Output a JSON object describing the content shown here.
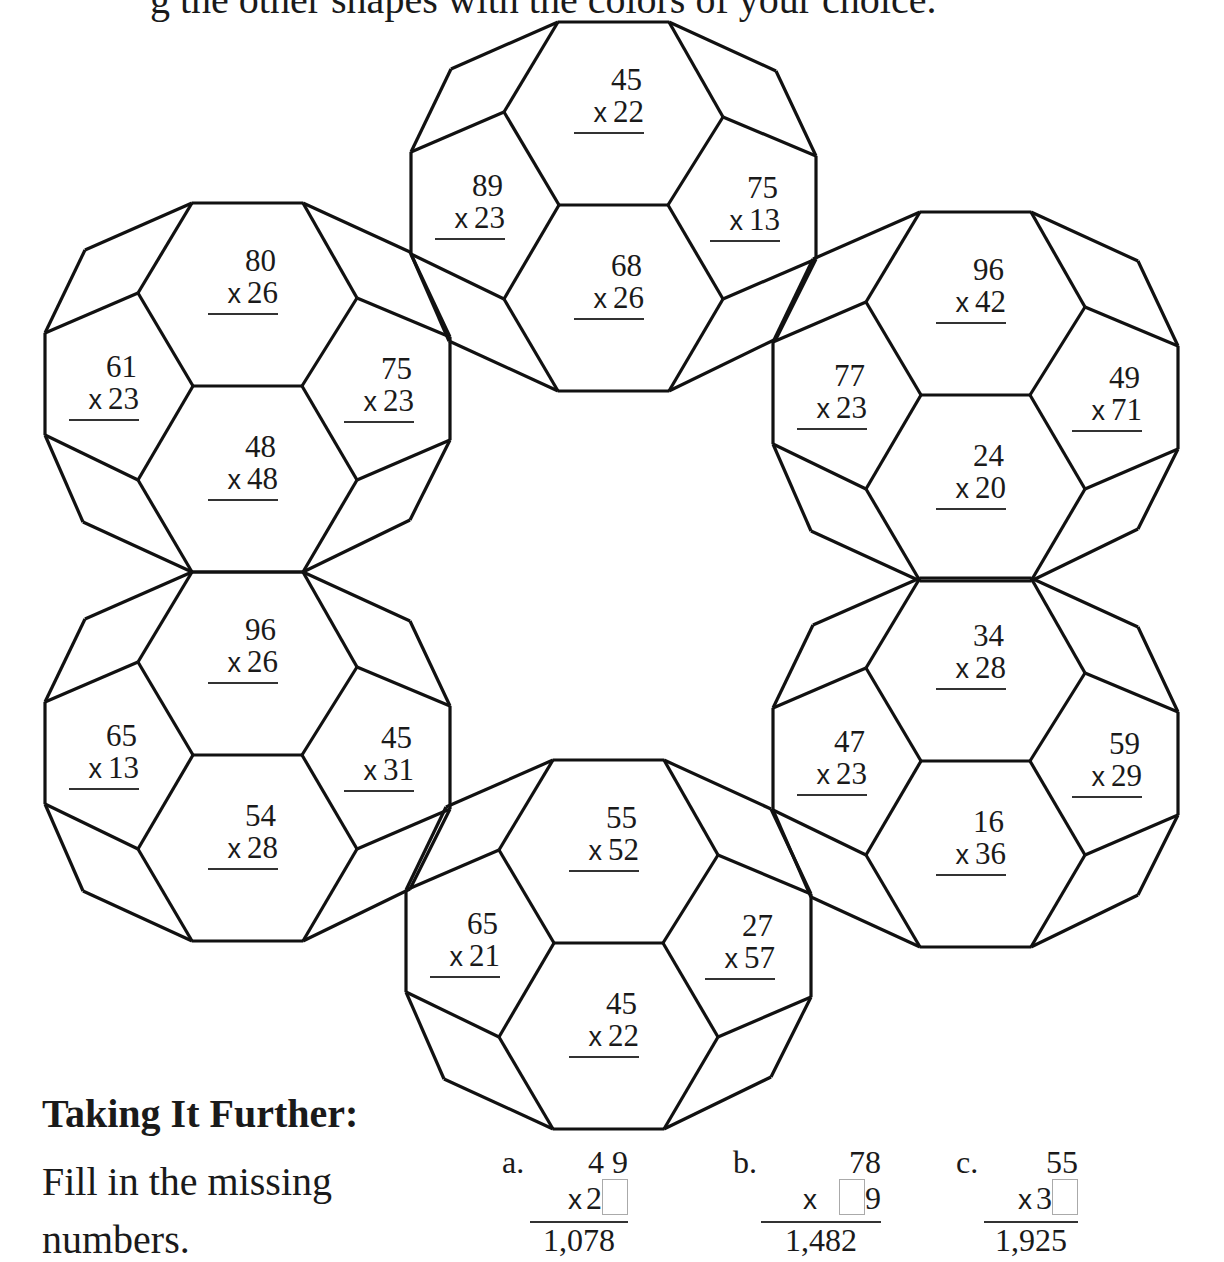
{
  "header": {
    "text": "g the other shapes with the colors of your choice."
  },
  "balls": [
    {
      "id": "top",
      "origin": [
        558,
        22
      ],
      "problems": {
        "top_hex": {
          "a": "45",
          "b": "22"
        },
        "left_pent": {
          "a": "89",
          "b": "23"
        },
        "right_pent": {
          "a": "75",
          "b": "13"
        },
        "mid_hex": {
          "a": "68",
          "b": "26"
        }
      }
    },
    {
      "id": "top-left",
      "origin": [
        192,
        203
      ],
      "problems": {
        "top_hex": {
          "a": "80",
          "b": "26"
        },
        "left_pent": {
          "a": "61",
          "b": "23"
        },
        "right_pent": {
          "a": "75",
          "b": "23"
        },
        "mid_hex": {
          "a": "48",
          "b": "48"
        }
      }
    },
    {
      "id": "top-right",
      "origin": [
        920,
        212
      ],
      "problems": {
        "top_hex": {
          "a": "96",
          "b": "42"
        },
        "left_pent": {
          "a": "77",
          "b": "23"
        },
        "right_pent": {
          "a": "49",
          "b": "71"
        },
        "mid_hex": {
          "a": "24",
          "b": "20"
        }
      }
    },
    {
      "id": "bottom-left",
      "origin": [
        192,
        572
      ],
      "problems": {
        "top_hex": {
          "a": "96",
          "b": "26"
        },
        "left_pent": {
          "a": "65",
          "b": "13"
        },
        "right_pent": {
          "a": "45",
          "b": "31"
        },
        "mid_hex": {
          "a": "54",
          "b": "28"
        }
      }
    },
    {
      "id": "bottom-right",
      "origin": [
        920,
        578
      ],
      "problems": {
        "top_hex": {
          "a": "34",
          "b": "28"
        },
        "left_pent": {
          "a": "47",
          "b": "23"
        },
        "right_pent": {
          "a": "59",
          "b": "29"
        },
        "mid_hex": {
          "a": "16",
          "b": "36"
        }
      }
    },
    {
      "id": "bottom",
      "origin": [
        553,
        760
      ],
      "problems": {
        "top_hex": {
          "a": "55",
          "b": "52"
        },
        "left_pent": {
          "a": "65",
          "b": "21"
        },
        "right_pent": {
          "a": "27",
          "b": "57"
        },
        "mid_hex": {
          "a": "45",
          "b": "22"
        }
      }
    }
  ],
  "operator": "x",
  "taking_further": {
    "title": "Taking It Further:",
    "body": "Fill in the missing numbers."
  },
  "exercises": [
    {
      "letter": "a.",
      "top": "4 9",
      "mult_prefix": "2",
      "mult_suffix": "",
      "box_position": "end",
      "result": "1,078"
    },
    {
      "letter": "b.",
      "top": "78",
      "mult_prefix": "",
      "mult_suffix": "9",
      "box_position": "middle",
      "result": "1,482"
    },
    {
      "letter": "c.",
      "top": "55",
      "mult_prefix": "3",
      "mult_suffix": "",
      "box_position": "end",
      "result": "1,925"
    }
  ]
}
